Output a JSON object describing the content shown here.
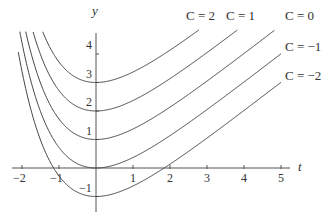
{
  "chart_data": {
    "type": "line",
    "title": "",
    "xlabel": "t",
    "ylabel": "y",
    "xlim": [
      -2.1,
      5.3
    ],
    "ylim": [
      -1.25,
      4.8
    ],
    "grid": false,
    "function": "y = t + e^(-t) + C",
    "x_ticks": [
      -2,
      -1,
      1,
      2,
      3,
      4,
      5
    ],
    "x_tick_labels": [
      "−2",
      "−1",
      "1",
      "2",
      "3",
      "4",
      "5"
    ],
    "y_ticks": [
      -1,
      1,
      2,
      3,
      4
    ],
    "y_tick_labels": [
      "−1",
      "1",
      "2",
      "3",
      "4"
    ],
    "series": [
      {
        "name": "C = 2",
        "C": 2,
        "y_at_0": 3
      },
      {
        "name": "C = 1",
        "C": 1,
        "y_at_0": 2
      },
      {
        "name": "C = 0",
        "C": 0,
        "y_at_0": 1
      },
      {
        "name": "C = −1",
        "C": -1,
        "y_at_0": 0
      },
      {
        "name": "C = −2",
        "C": -2,
        "y_at_0": -1
      }
    ],
    "legend_labels": [
      {
        "text": "C = 2",
        "x": 186,
        "y": 9
      },
      {
        "text": "C = 1",
        "x": 226,
        "y": 9
      },
      {
        "text": "C = 0",
        "x": 285,
        "y": 9
      },
      {
        "text": "C = −1",
        "x": 285,
        "y": 40
      },
      {
        "text": "C = −2",
        "x": 285,
        "y": 69
      }
    ]
  },
  "axes": {
    "x_name": "t",
    "y_name": "y"
  }
}
